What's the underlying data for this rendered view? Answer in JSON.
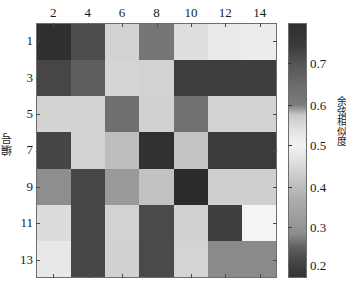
{
  "figure": {
    "background": "#ffffff",
    "axis_color": "#6e6e6e"
  },
  "axes": {
    "x": {
      "tick_labels": [
        "2",
        "4",
        "6",
        "8",
        "10",
        "12",
        "14"
      ],
      "title": ""
    },
    "y": {
      "tick_labels": [
        "1",
        "3",
        "5",
        "7",
        "9",
        "11",
        "13"
      ],
      "title": "编号"
    }
  },
  "colorbar": {
    "title": "余弦相似度",
    "tick_labels": [
      "0.7",
      "0.6",
      "0.5",
      "0.4",
      "0.3",
      "0.2"
    ],
    "tick_values": [
      0.7,
      0.6,
      0.5,
      0.4,
      0.3,
      0.2
    ],
    "tick_positions_pct": [
      15.7,
      32.2,
      48.0,
      64.3,
      80.0,
      94.9
    ],
    "gradient_stops": [
      {
        "pos": 0,
        "color": "#2e2e2e"
      },
      {
        "pos": 8,
        "color": "#3a3a3a"
      },
      {
        "pos": 16,
        "color": "#555555"
      },
      {
        "pos": 25,
        "color": "#6e6e6e"
      },
      {
        "pos": 32,
        "color": "#7c7c7c"
      },
      {
        "pos": 36,
        "color": "#c9c9c9"
      },
      {
        "pos": 42,
        "color": "#e2e2e2"
      },
      {
        "pos": 48,
        "color": "#f2f2f2"
      },
      {
        "pos": 54,
        "color": "#e0e0e0"
      },
      {
        "pos": 62,
        "color": "#c4c4c4"
      },
      {
        "pos": 70,
        "color": "#ababab"
      },
      {
        "pos": 78,
        "color": "#9a9a9a"
      },
      {
        "pos": 83,
        "color": "#8c8c8c"
      },
      {
        "pos": 88,
        "color": "#616161"
      },
      {
        "pos": 94,
        "color": "#454545"
      },
      {
        "pos": 100,
        "color": "#333333"
      }
    ]
  },
  "chart_data": {
    "type": "heatmap",
    "title": "",
    "xlabel": "",
    "ylabel": "编号",
    "colorbar_label": "余弦相似度",
    "x_tick_labels": [
      "2",
      "4",
      "6",
      "8",
      "10",
      "12",
      "14"
    ],
    "y_tick_labels": [
      "1",
      "3",
      "5",
      "7",
      "9",
      "11",
      "13"
    ],
    "colormap": "gray-nonmonotonic",
    "clim": [
      0.15,
      0.8
    ],
    "grid": false,
    "rows": 7,
    "cols": 7,
    "values": [
      [
        0.78,
        0.71,
        0.47,
        0.63,
        0.44,
        0.4,
        0.41
      ],
      [
        0.72,
        0.66,
        0.46,
        0.47,
        0.75,
        0.75,
        0.75
      ],
      [
        0.45,
        0.46,
        0.65,
        0.46,
        0.64,
        0.45,
        0.45
      ],
      [
        0.73,
        0.45,
        0.52,
        0.79,
        0.49,
        0.76,
        0.76
      ],
      [
        0.61,
        0.73,
        0.6,
        0.49,
        0.8,
        0.46,
        0.46
      ],
      [
        0.43,
        0.74,
        0.45,
        0.74,
        0.46,
        0.76,
        0.38
      ],
      [
        0.4,
        0.74,
        0.46,
        0.74,
        0.45,
        0.62,
        0.62
      ]
    ],
    "cell_colors": [
      [
        "#2f2f2f",
        "#4d4d4d",
        "#d2d2d2",
        "#767676",
        "#dedede",
        "#eaeaea",
        "#ececec"
      ],
      [
        "#464646",
        "#5e5e5e",
        "#d4d4d4",
        "#d2d2d2",
        "#3e3e3e",
        "#3e3e3e",
        "#3e3e3e"
      ],
      [
        "#d3d3d3",
        "#d2d2d2",
        "#6f6f6f",
        "#d1d1d1",
        "#717171",
        "#d2d2d2",
        "#d2d2d2"
      ],
      [
        "#454545",
        "#d2d2d2",
        "#bdbdbd",
        "#313131",
        "#c3c3c3",
        "#3b3b3b",
        "#3b3b3b"
      ],
      [
        "#8e8e8e",
        "#464646",
        "#9a9a9a",
        "#c2c2c2",
        "#2b2b2b",
        "#cfcfcf",
        "#cfcfcf"
      ],
      [
        "#dcdcdc",
        "#474747",
        "#d2d2d2",
        "#4a4a4a",
        "#d1d1d1",
        "#3f3f3f",
        "#f4f4f4"
      ],
      [
        "#e8e8e8",
        "#474747",
        "#d1d1d1",
        "#4a4a4a",
        "#d4d4d4",
        "#8a8a8a",
        "#8a8a8a"
      ]
    ]
  }
}
